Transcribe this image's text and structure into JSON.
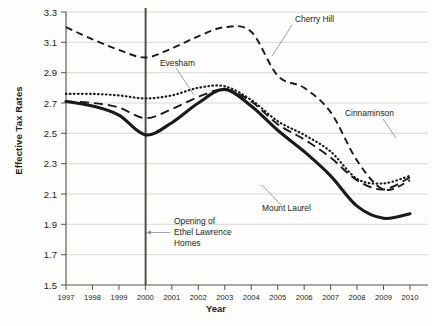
{
  "chart_data": {
    "type": "line",
    "title": "",
    "xlabel": "Year",
    "ylabel": "Effective Tax Rates",
    "xlim": [
      1997,
      2010
    ],
    "ylim": [
      1.5,
      3.3
    ],
    "ytick_step": 0.2,
    "grid": true,
    "legend": "inline-annotations",
    "x": [
      1997,
      1998,
      1999,
      2000,
      2001,
      2002,
      2003,
      2004,
      2005,
      2006,
      2007,
      2008,
      2009,
      2010
    ],
    "xticklabels": [
      "1997",
      "1998",
      "1999",
      "2000",
      "2001",
      "2002",
      "2003",
      "2004",
      "2005",
      "2006",
      "2007",
      "2008",
      "2009",
      "2010"
    ],
    "yticklabels": [
      "1.5",
      "1.7",
      "1.9",
      "2.1",
      "2.3",
      "2.5",
      "2.7",
      "2.9",
      "3.1",
      "3.3"
    ],
    "series": [
      {
        "name": "Cherry Hill",
        "style": "dashed-short",
        "values": [
          3.2,
          3.12,
          3.05,
          3.0,
          3.06,
          3.14,
          3.2,
          3.17,
          2.88,
          2.8,
          2.64,
          2.32,
          2.13,
          2.19
        ]
      },
      {
        "name": "Evesham",
        "style": "dashed-long",
        "values": [
          2.71,
          2.7,
          2.67,
          2.6,
          2.66,
          2.74,
          2.79,
          2.71,
          2.56,
          2.46,
          2.34,
          2.19,
          2.13,
          2.21
        ]
      },
      {
        "name": "Cinnaminson",
        "style": "dotted",
        "values": [
          2.76,
          2.76,
          2.75,
          2.73,
          2.75,
          2.8,
          2.81,
          2.72,
          2.58,
          2.49,
          2.38,
          2.2,
          2.17,
          2.22
        ]
      },
      {
        "name": "Mount Laurel",
        "style": "solid",
        "values": [
          2.71,
          2.68,
          2.62,
          2.49,
          2.57,
          2.7,
          2.79,
          2.68,
          2.52,
          2.38,
          2.22,
          2.02,
          1.94,
          1.97
        ]
      }
    ],
    "annotations": [
      {
        "label": "Cherry Hill",
        "x": 2005,
        "y": 3.3
      },
      {
        "label": "Evesham",
        "x": 2000,
        "y": 2.91
      },
      {
        "label": "Cinnaminson",
        "x": 2008,
        "y": 2.64
      },
      {
        "label": "Mount Laurel",
        "x": 2005,
        "y": 2.06
      },
      {
        "label": "Opening of Ethel Lawrence Homes",
        "x": 2001,
        "y": 1.82
      }
    ],
    "event_marker": {
      "label_line_1": "Opening of",
      "label_line_2": "Ethel Lawrence",
      "label_line_3": "Homes",
      "year": 2000
    },
    "colors": {
      "line": "#1a1a1a",
      "grid": "#d8d8d4",
      "axis": "#55524e",
      "event": "#4a4744",
      "text": "#231f20",
      "background": "#fdfdfb"
    }
  }
}
